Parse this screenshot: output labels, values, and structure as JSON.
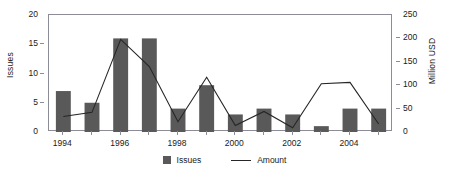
{
  "chart_data": {
    "type": "bar",
    "title": "",
    "subtitle": "",
    "xlabel": "",
    "ylabel": "Issues",
    "y2label": "Million USD",
    "categories": [
      "1994",
      "1995",
      "1996",
      "1997",
      "1998",
      "1999",
      "2000",
      "2001",
      "2002",
      "2003",
      "2004",
      "2005"
    ],
    "x_tick_labels": [
      "1994",
      "1996",
      "1998",
      "2000",
      "2002",
      "2004"
    ],
    "ylim": [
      0,
      20
    ],
    "y_ticks": [
      0,
      5,
      10,
      15,
      20
    ],
    "y2lim": [
      0,
      250
    ],
    "y2_ticks": [
      0,
      50,
      100,
      150,
      200,
      250
    ],
    "grid": false,
    "legend_position": "bottom-center",
    "series": [
      {
        "name": "Issues",
        "type": "bar",
        "axis": "left",
        "color": "#595959",
        "values": [
          7,
          5,
          16,
          16,
          4,
          8,
          3,
          4,
          3,
          1,
          4,
          4
        ]
      },
      {
        "name": "Amount",
        "type": "line",
        "axis": "right",
        "color": "#262626",
        "unit": "Million USD",
        "values": [
          33,
          42,
          198,
          140,
          22,
          117,
          14,
          44,
          9,
          103,
          106,
          17
        ]
      }
    ]
  },
  "legend": {
    "entries": [
      {
        "label": "Issues",
        "marker": "square-swatch-icon"
      },
      {
        "label": "Amount",
        "marker": "line-swatch-icon"
      }
    ]
  },
  "axes": {
    "left_title": "Issues",
    "right_title": "Million USD"
  }
}
